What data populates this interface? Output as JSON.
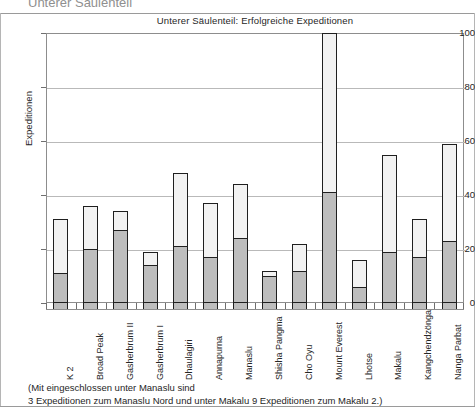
{
  "chart_data": {
    "type": "bar",
    "title": "Unterer Säulenteil: Erfolgreiche Expeditionen",
    "xlabel": "",
    "ylabel": "Expeditionen",
    "ylim": [
      0,
      100
    ],
    "yticks": [
      0,
      20,
      40,
      60,
      80,
      100
    ],
    "grid": true,
    "legend": "none",
    "stacked": true,
    "categories": [
      "K 2",
      "Broad Peak",
      "Gasherbrum II",
      "Gasherbrum I",
      "Dhaulagiri",
      "Annapurna",
      "Manaslu",
      "Shisha Pangma",
      "Cho Oyu",
      "Mount Everest",
      "Lhotse",
      "Makalu",
      "Kangchendzönga",
      "Nanga Parbat"
    ],
    "series": [
      {
        "name": "Erfolgreiche Expeditionen",
        "color": "#bdbdbd",
        "values": [
          11,
          20,
          27,
          14,
          21,
          17,
          24,
          10,
          12,
          41,
          6,
          19,
          17,
          23
        ]
      },
      {
        "name": "Übrige Expeditionen",
        "color": "#f2f2f2",
        "values": [
          20,
          16,
          7,
          5,
          27,
          20,
          20,
          2,
          10,
          59,
          10,
          36,
          14,
          36
        ]
      }
    ],
    "totals": [
      31,
      36,
      34,
      19,
      48,
      37,
      44,
      12,
      22,
      100,
      16,
      55,
      31,
      59
    ],
    "annotations": [
      "(Mit eingeschlossen unter Manaslu sind",
      "3 Expeditionen zum Manaslu Nord und unter Makalu 9 Expeditionen zum Makalu 2.)"
    ]
  },
  "figure": {
    "clipped_header": "Unterer Säulenteil"
  }
}
